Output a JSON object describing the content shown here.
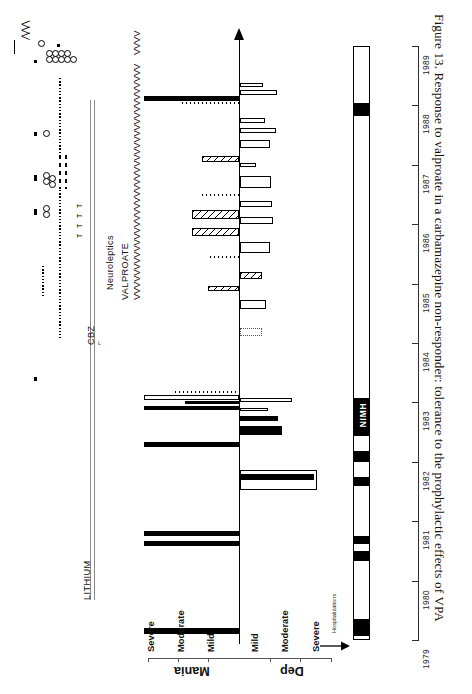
{
  "figure": {
    "caption": "Figure 13.  Response to valproate in a carbamazepine non-responder: tolerance to the prophylactic effects of VPA",
    "caption_number": "Figure 13.",
    "caption_text": "Response to valproate in a carbamazepine non-responder: tolerance to the prophylactic effects of VPA"
  },
  "axes": {
    "mania_group_label": "Mania",
    "dep_group_label": "Dep",
    "mania_levels": [
      "Severe",
      "Moderate",
      "Mild"
    ],
    "dep_levels": [
      "Mild",
      "Moderate",
      "Severe"
    ],
    "hospitalizations_label": "Hospitalizations",
    "year_ticks": [
      "1979",
      "1980",
      "1981",
      "1982",
      "1983",
      "1984",
      "1985",
      "1986",
      "1987",
      "1988",
      "1989"
    ],
    "year_range": [
      1979,
      1989
    ]
  },
  "medications": {
    "lithium_label": "LITHIUM",
    "cbz_label": "CBZ",
    "valproate_label": "VALPROATE",
    "neuroleptics_label": "Neuroleptics",
    "valproate_marks": "VVVVVVVVVVVVVVVVVVVVVVVVVVVVVVVVVVVVVVV",
    "valproate_marks_tail": "VVVV"
  },
  "hospitalizations": {
    "nimh_label": "NIMH",
    "episodes": [
      {
        "year_start": 1979.02,
        "year_end": 1979.22
      },
      {
        "year_start": 1980.1,
        "year_end": 1980.26
      },
      {
        "year_start": 1980.88,
        "year_end": 1981.02
      },
      {
        "year_start": 1981.8,
        "year_end": 1981.95
      },
      {
        "year_start": 1982.18,
        "year_end": 1982.34
      },
      {
        "year_start": 1982.46,
        "year_end": 1983.02,
        "label": "NIMH"
      },
      {
        "year_start": 1988.58,
        "year_end": 1988.8
      }
    ]
  },
  "chart_data": {
    "type": "bar",
    "title": "Response to valproate in a carbamazepine non-responder: tolerance to the prophylactic effects of VPA",
    "xlabel": "Year",
    "ylabel": "Mood severity (Mania / Depression)",
    "xlim": [
      1979,
      1989
    ],
    "grid": false,
    "legend": "none",
    "orientation": "horizontal-time-vertical-severity-rotated",
    "severity_scale": {
      "mania": {
        "Mild": 1,
        "Moderate": 2,
        "Severe": 3
      },
      "depression": {
        "Mild": 1,
        "Moderate": 2,
        "Severe": 3
      }
    },
    "series": [
      {
        "name": "Mania episodes",
        "direction": "up",
        "fill_key": {
          "solid": "severe/continuous",
          "hatch": "hatched",
          "open": "outline",
          "dotted": "dotted"
        },
        "values": [
          {
            "year_start": 1979.04,
            "year_end": 1979.22,
            "severity": 3.0,
            "fill": "solid"
          },
          {
            "year_start": 1980.12,
            "year_end": 1980.26,
            "severity": 3.0,
            "fill": "solid"
          },
          {
            "year_start": 1980.36,
            "year_end": 1980.5,
            "severity": 3.0,
            "fill": "solid"
          },
          {
            "year_start": 1981.56,
            "year_end": 1981.7,
            "severity": 3.0,
            "fill": "solid"
          },
          {
            "year_start": 1982.42,
            "year_end": 1982.56,
            "severity": 3.0,
            "fill": "solid"
          },
          {
            "year_start": 1982.46,
            "year_end": 1982.6,
            "severity": 1.6,
            "fill": "solid"
          },
          {
            "year_start": 1982.58,
            "year_end": 1982.7,
            "severity": 3.0,
            "fill": "open"
          },
          {
            "year_start": 1982.62,
            "year_end": 1982.74,
            "severity": 1.9,
            "fill": "dot"
          },
          {
            "year_start": 1985.34,
            "year_end": 1985.44,
            "severity": 1.1,
            "fill": "hatch"
          },
          {
            "year_start": 1985.84,
            "year_end": 1985.94,
            "severity": 0.9,
            "fill": "dot"
          },
          {
            "year_start": 1986.38,
            "year_end": 1986.58,
            "severity": 1.7,
            "fill": "hatch"
          },
          {
            "year_start": 1986.7,
            "year_end": 1986.9,
            "severity": 1.8,
            "fill": "hatch"
          },
          {
            "year_start": 1987.08,
            "year_end": 1987.16,
            "severity": 1.2,
            "fill": "dot"
          },
          {
            "year_start": 1987.92,
            "year_end": 1988.08,
            "severity": 1.5,
            "fill": "hatch"
          },
          {
            "year_start": 1988.66,
            "year_end": 1988.8,
            "severity": 3.0,
            "fill": "solid"
          },
          {
            "year_start": 1988.7,
            "year_end": 1988.82,
            "severity": 1.6,
            "fill": "dot"
          }
        ]
      },
      {
        "name": "Depression episodes",
        "direction": "down",
        "values": [
          {
            "year_start": 1982.04,
            "year_end": 1982.22,
            "severity": 2.9,
            "fill": "open"
          },
          {
            "year_start": 1982.1,
            "year_end": 1982.24,
            "severity": 2.6,
            "fill": "solid"
          },
          {
            "year_start": 1982.3,
            "year_end": 1982.42,
            "severity": 1.4,
            "fill": "solid"
          },
          {
            "year_start": 1982.38,
            "year_end": 1982.5,
            "severity": 1.3,
            "fill": "solid"
          },
          {
            "year_start": 1982.56,
            "year_end": 1982.68,
            "severity": 1.6,
            "fill": "open"
          },
          {
            "year_start": 1982.64,
            "year_end": 1982.74,
            "severity": 1.8,
            "fill": "open"
          },
          {
            "year_start": 1983.72,
            "year_end": 1983.84,
            "severity": 0.6,
            "fill": "dotbox"
          },
          {
            "year_start": 1984.16,
            "year_end": 1984.32,
            "severity": 0.8,
            "fill": "open"
          },
          {
            "year_start": 1985.24,
            "year_end": 1985.42,
            "severity": 0.9,
            "fill": "open"
          },
          {
            "year_start": 1986.12,
            "year_end": 1986.3,
            "severity": 0.9,
            "fill": "open"
          },
          {
            "year_start": 1986.54,
            "year_end": 1986.66,
            "severity": 1.1,
            "fill": "open"
          },
          {
            "year_start": 1986.86,
            "year_end": 1086.98,
            "severity": 1.2,
            "fill": "open"
          },
          {
            "year_start": 1987.22,
            "year_end": 1987.4,
            "severity": 0.9,
            "fill": "open"
          },
          {
            "year_start": 1987.86,
            "year_end": 1987.96,
            "severity": 0.6,
            "fill": "open"
          },
          {
            "year_start": 1988.04,
            "year_end": 1988.2,
            "severity": 1.1,
            "fill": "open"
          },
          {
            "year_start": 1988.84,
            "year_end": 1988.98,
            "severity": 1.0,
            "fill": "open"
          }
        ]
      }
    ]
  }
}
